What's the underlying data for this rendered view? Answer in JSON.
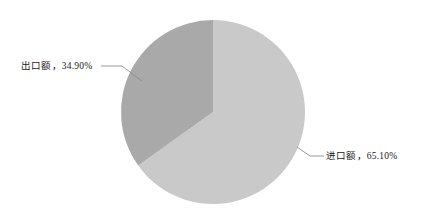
{
  "chart_data": {
    "type": "pie",
    "title": "",
    "subtitle": "",
    "xlabel": "",
    "ylabel": "",
    "legend_position": "none",
    "grid": false,
    "labels_outside": true,
    "categories": [
      "进口额",
      "出口额"
    ],
    "values": [
      65.1,
      34.9
    ],
    "value_unit": "%",
    "slices": [
      {
        "name": "进口额",
        "value": 65.1,
        "value_text": "65.10%",
        "label": "进口额，65.10%",
        "color": "#c9c9c9",
        "start_angle_deg": 0,
        "sweep_angle_deg": 234.36,
        "label_side": "right"
      },
      {
        "name": "出口额",
        "value": 34.9,
        "value_text": "34.90%",
        "label": "出口额，34.90%",
        "color": "#a9a9a9",
        "start_angle_deg": 234.36,
        "sweep_angle_deg": 125.64,
        "label_side": "left"
      }
    ]
  },
  "geometry": {
    "center_x": 213,
    "center_y": 112,
    "radius": 92
  },
  "colors": {
    "background": "#ffffff",
    "slice_import": "#c9c9c9",
    "slice_export": "#a9a9a9",
    "leader_line": "#8c8c8c",
    "text": "#1a1a1a"
  },
  "labels": {
    "export": "出口额，34.90%",
    "import": "进口额，65.10%"
  }
}
